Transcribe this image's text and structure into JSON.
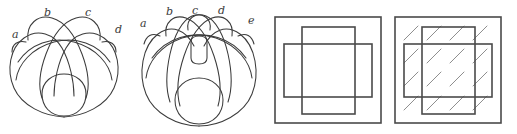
{
  "plate": {
    "background_color": "#ffffff",
    "stroke_color_curves": "#3b3b3b",
    "stroke_color_boxes": "#4a4a4a",
    "stroke_color_hatching": "#8e8e8e",
    "figure_count": 4
  },
  "figures": [
    {
      "id": "knot-diagram-4-labels",
      "type": "knot-diagram",
      "label_count": 4,
      "labels": [
        {
          "text": "a",
          "x": 12,
          "y": 38
        },
        {
          "text": "b",
          "x": 44,
          "y": 16
        },
        {
          "text": "c",
          "x": 85,
          "y": 16
        },
        {
          "text": "d",
          "x": 115,
          "y": 33
        }
      ]
    },
    {
      "id": "knot-diagram-5-labels",
      "type": "knot-diagram",
      "label_count": 5,
      "labels": [
        {
          "text": "a",
          "x": 12,
          "y": 27
        },
        {
          "text": "b",
          "x": 38,
          "y": 15
        },
        {
          "text": "c",
          "x": 64,
          "y": 14
        },
        {
          "text": "d",
          "x": 90,
          "y": 14
        },
        {
          "text": "e",
          "x": 120,
          "y": 24
        }
      ]
    },
    {
      "id": "cross-squares-plain",
      "type": "overlapping-squares",
      "square_count": 3,
      "hatched": false,
      "description_parts": [
        "outer-square",
        "vertical-rectangle",
        "horizontal-rectangle"
      ]
    },
    {
      "id": "cross-squares-hatched",
      "type": "overlapping-squares",
      "square_count": 3,
      "hatched": true,
      "hatch_direction": "bottom-left-to-top-right",
      "hatch_cell_rows": 4,
      "hatch_cell_cols": 4,
      "description_parts": [
        "outer-square",
        "vertical-rectangle",
        "horizontal-rectangle",
        "diagonal-hatching"
      ]
    }
  ]
}
